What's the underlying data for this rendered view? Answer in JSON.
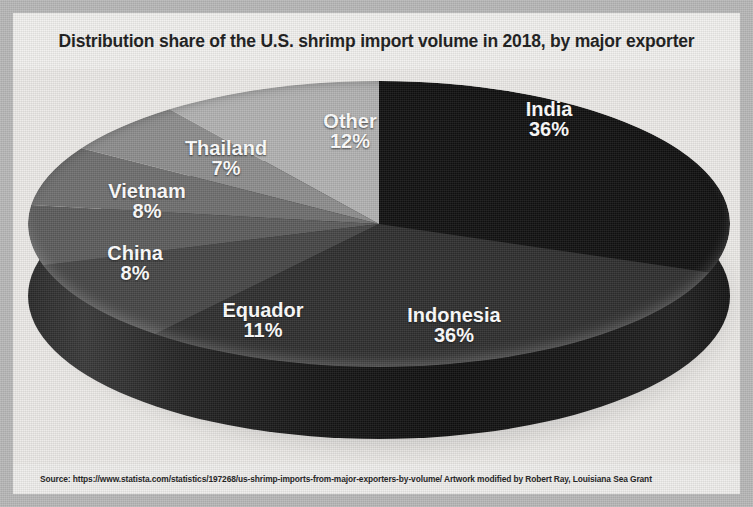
{
  "title": "Distribution share of the U.S. shrimp import volume in 2018, by major exporter",
  "source": "Source: https://www.statista.com/statistics/197268/us-shrimp-imports-from-major-exporters-by-volume/   Artwork modified by Robert Ray, Louisiana Sea Grant",
  "chart_data": {
    "type": "pie",
    "title": "Distribution share of the U.S. shrimp import volume in 2018, by major exporter",
    "xlabel": "",
    "ylabel": "",
    "legend": "none",
    "grid": false,
    "style": "3d-pie",
    "unit": "%",
    "categories": [
      "India",
      "Indonesia",
      "Equador",
      "China",
      "Vietnam",
      "Thailand",
      "Other"
    ],
    "values": [
      36,
      36,
      11,
      8,
      8,
      7,
      12
    ],
    "labels": [
      "36%",
      "36%",
      "11%",
      "8%",
      "8%",
      "7%",
      "12%"
    ],
    "colors": [
      "#111111",
      "#2f2f2f",
      "#464646",
      "#5d5d5d",
      "#6f6f6f",
      "#8e8e8e",
      "#b3b3b3"
    ],
    "slices": [
      {
        "name": "India",
        "value": 36,
        "label": "36%",
        "color": "#111111"
      },
      {
        "name": "Indonesia",
        "value": 36,
        "label": "36%",
        "color": "#2f2f2f"
      },
      {
        "name": "Equador",
        "value": 11,
        "label": "11%",
        "color": "#464646"
      },
      {
        "name": "China",
        "value": 8,
        "label": "8%",
        "color": "#5d5d5d"
      },
      {
        "name": "Vietnam",
        "value": 8,
        "label": "8%",
        "color": "#6f6f6f"
      },
      {
        "name": "Thailand",
        "value": 7,
        "label": "7%",
        "color": "#8e8e8e"
      },
      {
        "name": "Other",
        "value": 12,
        "label": "12%",
        "color": "#b3b3b3"
      }
    ]
  },
  "colors": {
    "frame": "#b9b9b9",
    "panel": "#eceae7",
    "title_text": "#1a1a1a",
    "label_text": "#ffffff"
  }
}
